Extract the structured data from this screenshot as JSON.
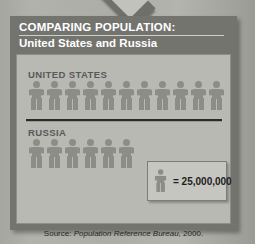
{
  "title": {
    "line1": "COMPARING POPULATION:",
    "line2": "United States and Russia"
  },
  "source": {
    "label": "Source:",
    "reference": "Population Reference Bureau,",
    "year": "2000."
  },
  "legend": {
    "icon": "person-icon",
    "text": "= 25,000,000",
    "unit_value": 25000000
  },
  "colors": {
    "frame": "#74746f",
    "panel": "#b9b9b3",
    "figure": "#8d8d88",
    "title_text": "#ffffff",
    "label_text": "#58585a",
    "divider": "#2b2b2b",
    "legend_bg": "#c6c6c0",
    "page_bg": "#adada7"
  },
  "chart_data": {
    "type": "bar",
    "subtype": "pictogram",
    "title": "COMPARING POPULATION: United States and Russia",
    "xlabel": "",
    "ylabel": "Population",
    "unit_per_icon": 25000000,
    "unit_label": "= 25,000,000",
    "categories": [
      "UNITED STATES",
      "RUSSIA"
    ],
    "icon_counts": [
      11,
      6
    ],
    "values": [
      275000000,
      150000000
    ],
    "series": [
      {
        "name": "Population 2000",
        "values": [
          275000000,
          150000000
        ]
      }
    ],
    "annotations": [
      "Source: Population Reference Bureau, 2000."
    ],
    "legend_position": "bottom-right",
    "grid": false
  },
  "rows": [
    {
      "label": "UNITED STATES",
      "icons": [
        1,
        2,
        3,
        4,
        5,
        6,
        7,
        8,
        9,
        10,
        11
      ]
    },
    {
      "label": "RUSSIA",
      "icons": [
        1,
        2,
        3,
        4,
        5,
        6
      ]
    }
  ]
}
